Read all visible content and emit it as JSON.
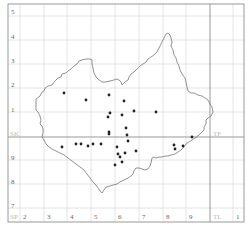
{
  "map": {
    "frame": {
      "x": 8,
      "y": 4,
      "width": 236,
      "height": 218,
      "color": "#999999"
    },
    "grid_color": "#dddddd",
    "major_line_color": "#999999",
    "outline_color": "#777777",
    "point_color": "#222222",
    "vertical_lines": [
      20,
      44,
      67,
      91,
      115,
      139,
      163,
      186,
      210,
      233
    ],
    "major_vertical_line": 210,
    "horizontal_lines": [
      16,
      40,
      64,
      88,
      112,
      137,
      160,
      184,
      208
    ],
    "major_horizontal_line": 137,
    "left_labels": [
      {
        "text": "5",
        "y": 14
      },
      {
        "text": "4",
        "y": 39
      },
      {
        "text": "3",
        "y": 63
      },
      {
        "text": "2",
        "y": 87
      },
      {
        "text": "1",
        "y": 112
      },
      {
        "text": "9",
        "y": 160
      },
      {
        "text": "8",
        "y": 184
      },
      {
        "text": "7",
        "y": 208
      }
    ],
    "bottom_labels": [
      {
        "text": "2",
        "x": 23
      },
      {
        "text": "3",
        "x": 47
      },
      {
        "text": "4",
        "x": 70
      },
      {
        "text": "5",
        "x": 94
      },
      {
        "text": "6",
        "x": 118
      },
      {
        "text": "7",
        "x": 142
      },
      {
        "text": "8",
        "x": 166
      },
      {
        "text": "9",
        "x": 189
      },
      {
        "text": "1",
        "x": 236
      }
    ],
    "square_labels": [
      {
        "text": "SK",
        "x": 10,
        "y": 136
      },
      {
        "text": "TF",
        "x": 213,
        "y": 136
      },
      {
        "text": "SP",
        "x": 10,
        "y": 219
      },
      {
        "text": "TL",
        "x": 213,
        "y": 219
      }
    ],
    "points": [
      [
        64,
        93
      ],
      [
        86,
        100
      ],
      [
        109,
        95
      ],
      [
        124,
        101
      ],
      [
        110,
        113
      ],
      [
        108,
        117
      ],
      [
        122,
        115
      ],
      [
        134,
        111
      ],
      [
        109,
        132
      ],
      [
        109,
        134
      ],
      [
        126,
        128
      ],
      [
        127,
        135
      ],
      [
        128,
        141
      ],
      [
        156,
        112
      ],
      [
        62,
        147
      ],
      [
        76,
        144
      ],
      [
        81,
        144
      ],
      [
        88,
        146
      ],
      [
        93,
        144
      ],
      [
        101,
        144
      ],
      [
        117,
        147
      ],
      [
        118,
        154
      ],
      [
        120,
        157
      ],
      [
        125,
        153
      ],
      [
        122,
        162
      ],
      [
        115,
        165
      ],
      [
        136,
        151
      ],
      [
        174,
        145
      ],
      [
        175,
        149
      ],
      [
        183,
        146
      ],
      [
        192,
        137
      ]
    ],
    "outline": "M36,99 L40,96 L42,92 L44,91 L45,88 L48,86 L52,85 L54,82 L56,80 L58,78 L61,77 L62,74 L66,73 L68,71 L71,69 L74,66 L77,64 L79,61 L82,60 L86,59 L90,59 L92,60 L92,64 L93,68 L94,73 L96,77 L99,80 L102,82 L106,82 L110,81 L114,80 L117,79 L119,80 L121,82 L122,85 L125,82 L128,80 L129,77 L131,74 L134,72 L137,69 L140,66 L143,64 L146,62 L148,59 L151,57 L154,55 L157,52 L159,48 L161,44 L163,40 L165,36 L166,34 L168,33 L170,35 L171,38 L172,42 L171,46 L173,50 L174,55 L176,58 L177,62 L179,66 L180,70 L182,74 L185,78 L186,82 L187,87 L188,91 L191,93 L194,93 L198,95 L202,96 L205,98 L208,100 L210,104 L212,107 L213,112 L211,116 L208,118 L206,120 L206,124 L204,127 L204,130 L202,132 L199,135 L195,138 L192,140 L189,142 L186,144 L184,147 L181,150 L178,152 L175,154 L171,155 L168,156 L165,156 L162,157 L159,157 L156,158 L154,157 L152,158 L151,163 L150,166 L148,169 L145,170 L142,169 L139,168 L136,168 L134,171 L133,174 L131,176 L128,178 L124,180 L120,182 L117,184 L113,185 L110,186 L106,187 L104,190 L102,193 L100,191 L98,188 L96,185 L93,182 L90,178 L87,174 L84,170 L80,167 L76,164 L72,161 L68,158 L64,155 L60,153 L56,151 L52,149 L49,147 L46,144 L44,140 L42,137 L43,133 L43,129 L42,126 L40,124 L41,120 L40,116 L38,112 L36,110 L36,106 Z"
  }
}
